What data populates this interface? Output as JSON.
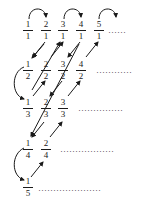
{
  "diagram": {
    "rows": [
      {
        "fractions": [
          {
            "n": "1",
            "d": "1"
          },
          {
            "n": "2",
            "d": "1"
          },
          {
            "n": "3",
            "d": "1"
          },
          {
            "n": "4",
            "d": "1"
          },
          {
            "n": "5",
            "d": "1"
          }
        ],
        "continuation": "……"
      },
      {
        "fractions": [
          {
            "n": "1",
            "d": "2"
          },
          {
            "n": "2",
            "d": "2"
          },
          {
            "n": "3",
            "d": "2"
          },
          {
            "n": "4",
            "d": "2"
          }
        ],
        "continuation": "…………"
      },
      {
        "fractions": [
          {
            "n": "1",
            "d": "3"
          },
          {
            "n": "2",
            "d": "3"
          },
          {
            "n": "3",
            "d": "3"
          }
        ],
        "continuation": "……………"
      },
      {
        "fractions": [
          {
            "n": "1",
            "d": "4"
          },
          {
            "n": "2",
            "d": "4"
          }
        ],
        "continuation": "………………"
      },
      {
        "fractions": [
          {
            "n": "1",
            "d": "5"
          }
        ],
        "continuation": "…………………"
      }
    ],
    "colors": {
      "ink": "#1a1a1a"
    }
  }
}
